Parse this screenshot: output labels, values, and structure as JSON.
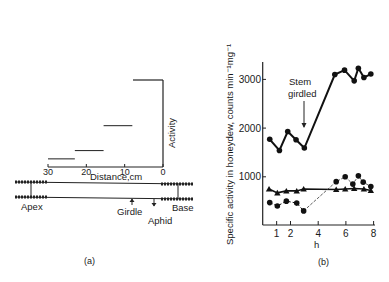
{
  "chart_data": [
    {
      "panel": "(a)",
      "type": "bar",
      "title": "",
      "xlabel": "Distance,cm",
      "ylabel": "Activity",
      "x_ticks": [
        "30",
        "20",
        "10",
        "0"
      ],
      "xlim": [
        30,
        0
      ],
      "segments": [
        {
          "x_from": 30,
          "x_to": 23,
          "level": 0.05
        },
        {
          "x_from": 23,
          "x_to": 15.5,
          "level": 0.15
        },
        {
          "x_from": 15.5,
          "x_to": 8,
          "level": 0.45
        },
        {
          "x_from": 8,
          "x_to": 0,
          "level": 1.0
        }
      ],
      "diagram_labels": {
        "apex": "Apex",
        "base": "Base",
        "girdle": "Girdle",
        "aphid": "Aphid"
      },
      "caption": "(a)"
    },
    {
      "panel": "(b)",
      "type": "line",
      "title": "",
      "xlabel": "h",
      "ylabel": "Specific activity in honeydew, counts min⁻¹mg⁻¹",
      "x_ticks": [
        "1",
        "2",
        "4",
        "6",
        "8"
      ],
      "y_ticks": [
        "1000",
        "2000",
        "3000"
      ],
      "xlim": [
        0,
        8.2
      ],
      "ylim": [
        0,
        3400
      ],
      "annotation": {
        "line1": "Stem",
        "line2": "girdled",
        "x": 3.0
      },
      "series": [
        {
          "name": "circles-solid-upper",
          "marker": "circle",
          "line": "solid",
          "x": [
            0.5,
            1.2,
            1.8,
            2.4,
            3.0,
            5.2,
            5.9,
            6.6,
            6.9,
            7.3,
            7.8
          ],
          "values": [
            1770,
            1540,
            1930,
            1760,
            1590,
            3100,
            3190,
            2970,
            3230,
            3040,
            3110
          ]
        },
        {
          "name": "triangles-solid",
          "marker": "triangle",
          "line": "solid",
          "x": [
            0.45,
            1.05,
            1.7,
            2.45,
            2.95,
            5.3,
            5.95,
            6.6,
            7.3,
            7.8
          ],
          "values": [
            750,
            670,
            710,
            710,
            750,
            740,
            750,
            760,
            750,
            720
          ]
        },
        {
          "name": "circles-dashed-lower",
          "marker": "circle",
          "line": "dashed",
          "x": [
            0.5,
            1.05,
            1.7,
            2.45,
            2.95,
            5.3,
            5.95,
            6.5,
            6.9,
            7.25,
            7.8
          ],
          "values": [
            470,
            400,
            500,
            460,
            300,
            900,
            1000,
            850,
            1020,
            890,
            800
          ]
        }
      ],
      "caption": "(b)"
    }
  ]
}
